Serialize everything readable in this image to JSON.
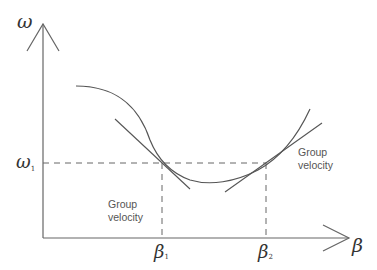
{
  "diagram": {
    "y_axis_label": "ω",
    "x_axis_label": "β",
    "omega_level_label": "ω",
    "omega_level_subscript": "1",
    "beta1_label": "β",
    "beta1_subscript": "1",
    "beta2_label": "β",
    "beta2_subscript": "2",
    "annotations": [
      {
        "line1": "Group",
        "line2": "velocity",
        "position": "left-below"
      },
      {
        "line1": "Group",
        "line2": "velocity",
        "position": "right"
      }
    ],
    "colors": {
      "line": "#555555",
      "text": "#333333",
      "background": "#ffffff"
    }
  }
}
